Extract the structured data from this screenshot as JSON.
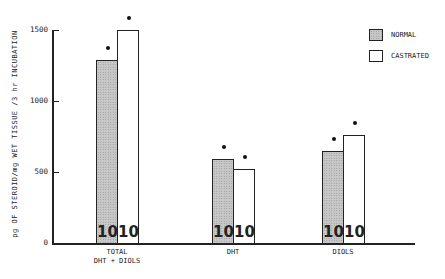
{
  "chart_data": {
    "type": "bar",
    "title": "",
    "xlabel": "",
    "ylabel": "pg OF STEROID/mg WET TISSUE /3 hr  INCUBATION",
    "ylim": [
      0,
      1500
    ],
    "yticks": [
      "0",
      "500",
      "1000",
      "1500"
    ],
    "grid": false,
    "legend_position": "upper right",
    "categories": [
      "TOTAL\nDHT + DIOLS",
      "DHT",
      "DIOLS"
    ],
    "category_lines": [
      [
        "TOTAL",
        "DHT + DIOLS"
      ],
      [
        "DHT"
      ],
      [
        "DIOLS"
      ]
    ],
    "series": [
      {
        "name": "NORMAL",
        "values": [
          1290,
          590,
          650
        ],
        "pattern": "stippled gray",
        "n": [
          "10",
          "10",
          "10"
        ]
      },
      {
        "name": "CASTRATED",
        "values": [
          1500,
          520,
          760
        ],
        "pattern": "white",
        "n": [
          "10",
          "10",
          "10"
        ]
      }
    ],
    "annotations": "Asterisk dot above each bar denotes significance"
  }
}
